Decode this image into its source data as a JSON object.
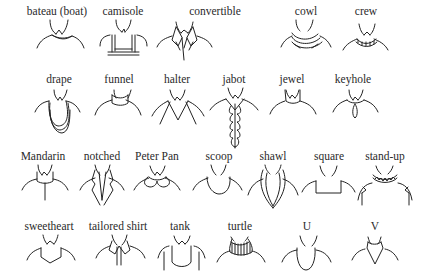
{
  "diagram": {
    "rows": [
      {
        "items": [
          {
            "id": "bateau",
            "label": "bateau (boat)",
            "x": 57,
            "ly": 5
          },
          {
            "id": "camisole",
            "label": "camisole",
            "x": 123,
            "ly": 5
          },
          {
            "id": "convertible",
            "label": "convertible",
            "x": 215,
            "ly": 5
          },
          {
            "id": "cowl",
            "label": "cowl",
            "x": 306,
            "ly": 5
          },
          {
            "id": "crew",
            "label": "crew",
            "x": 366,
            "ly": 5
          }
        ]
      },
      {
        "items": [
          {
            "id": "drape",
            "label": "drape",
            "x": 59,
            "ly": 73
          },
          {
            "id": "funnel",
            "label": "funnel",
            "x": 119,
            "ly": 73
          },
          {
            "id": "halter",
            "label": "halter",
            "x": 177,
            "ly": 73
          },
          {
            "id": "jabot",
            "label": "jabot",
            "x": 234,
            "ly": 73
          },
          {
            "id": "jewel",
            "label": "jewel",
            "x": 292,
            "ly": 73
          },
          {
            "id": "keyhole",
            "label": "keyhole",
            "x": 353,
            "ly": 73
          }
        ]
      },
      {
        "items": [
          {
            "id": "mandarin",
            "label": "Mandarin",
            "x": 43,
            "ly": 150
          },
          {
            "id": "notched",
            "label": "notched",
            "x": 102,
            "ly": 150
          },
          {
            "id": "peter-pan",
            "label": "Peter Pan",
            "x": 157,
            "ly": 150
          },
          {
            "id": "scoop",
            "label": "scoop",
            "x": 219,
            "ly": 150
          },
          {
            "id": "shawl",
            "label": "shawl",
            "x": 273,
            "ly": 150
          },
          {
            "id": "square",
            "label": "square",
            "x": 329,
            "ly": 150
          },
          {
            "id": "stand-up",
            "label": "stand-up",
            "x": 385,
            "ly": 150
          }
        ]
      },
      {
        "items": [
          {
            "id": "sweetheart",
            "label": "sweetheart",
            "x": 49,
            "ly": 220
          },
          {
            "id": "tailored-shirt",
            "label": "tailored shirt",
            "x": 118,
            "ly": 220
          },
          {
            "id": "tank",
            "label": "tank",
            "x": 180,
            "ly": 220
          },
          {
            "id": "turtle",
            "label": "turtle",
            "x": 240,
            "ly": 220
          },
          {
            "id": "u",
            "label": "U",
            "x": 307,
            "ly": 220
          },
          {
            "id": "v",
            "label": "V",
            "x": 375,
            "ly": 220
          }
        ]
      }
    ]
  }
}
